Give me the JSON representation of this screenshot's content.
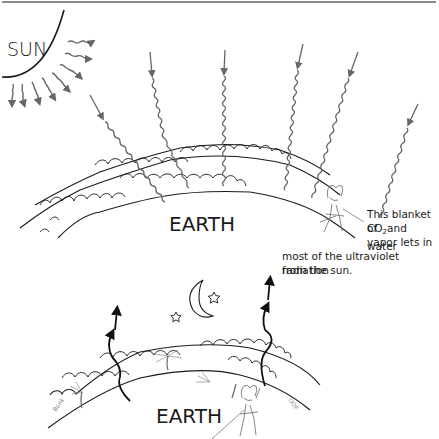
{
  "figure": {
    "sun_label": "SUN",
    "earth_label_top": "EARTH",
    "earth_label_bottom": "EARTH",
    "caption": {
      "line1": "This blanket of",
      "line2_prefix": "CO",
      "line2_sub": "2",
      "line2_suffix": "and water",
      "line3": "vapor lets in",
      "line4": "most of the ultraviolet radiation",
      "line5": "from the sun."
    },
    "small_labels": {
      "left_figure_text": "Bonk",
      "right_figure_text": "OOF"
    }
  },
  "colors": {
    "line": "#1a1a1a",
    "ray": "#666666",
    "rule": "#8a8a8a",
    "background": "#ffffff"
  }
}
